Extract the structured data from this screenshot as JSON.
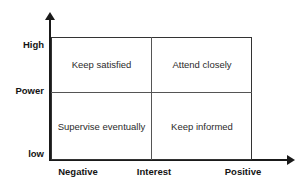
{
  "diagram": {
    "type": "2x2-matrix",
    "background_color": "#ffffff",
    "line_color": "#1a1a1a",
    "box_border_color": "#333333",
    "divider_color": "#555555",
    "text_color": "#2b2b2b",
    "label_color": "#141414"
  },
  "axes": {
    "y": {
      "name": "Power",
      "ticks": [
        {
          "label": "High",
          "position": "top"
        },
        {
          "label": "Power",
          "position": "middle"
        },
        {
          "label": "low",
          "position": "bottom"
        }
      ],
      "arrow": "up-arrow-icon"
    },
    "x": {
      "name": "Interest",
      "ticks": [
        {
          "label": "Negative",
          "position": "left"
        },
        {
          "label": "Interest",
          "position": "middle"
        },
        {
          "label": "Positive",
          "position": "right"
        }
      ],
      "arrow": "right-arrow-icon"
    }
  },
  "quadrants": [
    {
      "id": "top-left",
      "label": "Keep satisfied",
      "power": "High",
      "interest": "Negative"
    },
    {
      "id": "top-right",
      "label": "Attend closely",
      "power": "High",
      "interest": "Positive"
    },
    {
      "id": "bottom-left",
      "label": "Supervise eventually",
      "power": "low",
      "interest": "Negative"
    },
    {
      "id": "bottom-right",
      "label": "Keep informed",
      "power": "low",
      "interest": "Positive"
    }
  ]
}
